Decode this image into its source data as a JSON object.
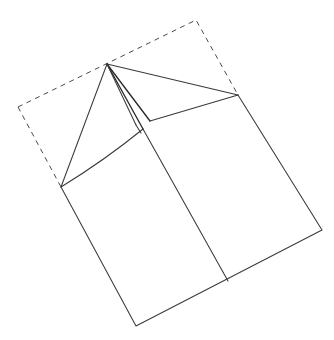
{
  "figure": {
    "title": "Paper folding diagram",
    "canvas": {
      "width": 334,
      "height": 340,
      "background": "#ffffff"
    },
    "stroke_colors": {
      "solid": "#3a3a3a",
      "solid_strong": "#2b2b2b",
      "dashed": "#4a4a4a"
    },
    "labels": [],
    "points": {
      "apex": {
        "name": "fold-apex",
        "x": 107,
        "y": 64
      },
      "dash_top": {
        "name": "dashed-top-corner",
        "x": 196,
        "y": 20
      },
      "dash_left": {
        "name": "dashed-left-corner",
        "x": 18,
        "y": 107
      },
      "right": {
        "name": "right-corner",
        "x": 238,
        "y": 95
      },
      "left": {
        "name": "left-corner",
        "x": 61,
        "y": 187
      },
      "bottom": {
        "name": "bottom-corner",
        "x": 136,
        "y": 326
      },
      "bottom_right": {
        "name": "bottom-right-corner",
        "x": 322,
        "y": 230
      },
      "crease_mid": {
        "name": "crease-midpoint",
        "x": 143,
        "y": 129
      },
      "crease_foot": {
        "name": "crease-foot",
        "x": 228,
        "y": 281
      },
      "flap_inner": {
        "name": "flap-inner-corner",
        "x": 150,
        "y": 121
      },
      "flap_edge": {
        "name": "flap-edge-point",
        "x": 136,
        "y": 125
      }
    },
    "paths": {
      "dashed_outline": "M 18 107 L 196 20 L 238 95",
      "dashed_outline_left": "M 18 107 L 61 187",
      "sheet_outline": "M 61 187 L 136 326 L 322 230 L 238 95",
      "fold_edge_left": "M 107 64 L 61 187",
      "fold_edge_right": "M 107 64 L 238 95",
      "crease_main": "M 143 129 L 228 281",
      "crease_upper": "M 107 64 L 143 129",
      "flap_line_a": "M 107 64 L 150 121",
      "flap_line_b": "M 107 64 L 136 125",
      "flap_base": "M 150 121 L 238 95",
      "curve_left": "M 61 187 Q 105 160 143 129",
      "hidden_edge": "M 136 125 L 141 133"
    }
  }
}
